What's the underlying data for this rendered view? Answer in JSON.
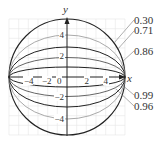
{
  "figure": {
    "axes": {
      "x_label": "x",
      "y_label": "y",
      "x_ticks": [
        "−4",
        "−2",
        "0",
        "2",
        "4"
      ],
      "y_ticks": [
        "4",
        "2",
        "−2",
        "−4"
      ]
    },
    "ellipses": [
      {
        "eccentricity_label": "0.30",
        "semi_major": 6,
        "semi_minor": 5.72,
        "color": "#222222"
      },
      {
        "eccentricity_label": "0.71",
        "semi_major": 6,
        "semi_minor": 4.22,
        "color": "#aaaaaa"
      },
      {
        "eccentricity_label": "0.86",
        "semi_major": 6,
        "semi_minor": 3.06,
        "color": "#222222"
      },
      {
        "eccentricity_label": "0.96",
        "semi_major": 6,
        "semi_minor": 1.68,
        "color": "#777777"
      },
      {
        "eccentricity_label": "0.99",
        "semi_major": 6,
        "semi_minor": 0.85,
        "color": "#222222"
      }
    ],
    "labels": {
      "e030": "0.30",
      "e071": "0.71",
      "e086": "0.86",
      "e099": "0.99",
      "e096": "0.96"
    }
  }
}
